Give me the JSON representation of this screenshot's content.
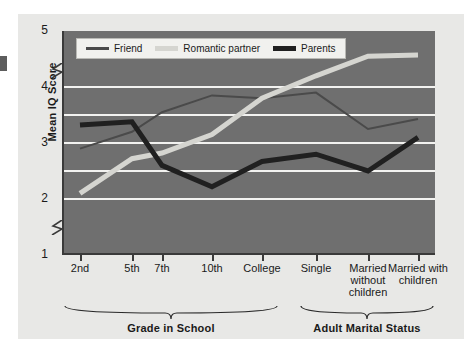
{
  "chart_data": {
    "type": "line",
    "title": "",
    "xlabel": "",
    "ylabel": "Mean IQ Score",
    "categories": [
      "2nd",
      "5th",
      "7th",
      "10th",
      "College",
      "Single",
      "Married without children",
      "Married with children"
    ],
    "ylim": [
      1,
      5
    ],
    "yticks": [
      1,
      2,
      3,
      4,
      5
    ],
    "ytick_labels": [
      "1",
      "2",
      "3",
      "4",
      "5"
    ],
    "gridlines": [
      2,
      2.5,
      3,
      3.5,
      4
    ],
    "grid": true,
    "axis_breaks": [
      1.5,
      4.3
    ],
    "legend_position": "top-left",
    "series": [
      {
        "name": "Friend",
        "color": "#4a4a4a",
        "width": 2,
        "values": [
          2.9,
          3.2,
          3.55,
          3.85,
          3.8,
          3.9,
          3.25,
          3.43
        ]
      },
      {
        "name": "Romantic partner",
        "color": "#d5d5d0",
        "width": 5,
        "values": [
          2.1,
          2.72,
          2.82,
          3.15,
          3.8,
          4.2,
          4.55,
          4.57
        ]
      },
      {
        "name": "Parents",
        "color": "#202020",
        "width": 5,
        "values": [
          3.32,
          3.38,
          2.6,
          2.22,
          2.67,
          2.8,
          2.5,
          3.1
        ]
      }
    ],
    "group_brackets": [
      {
        "label": "Grade in School",
        "from": 0,
        "to": 4
      },
      {
        "label": "Adult Marital Status",
        "from": 5,
        "to": 7
      }
    ]
  },
  "colors": {
    "plot_background": "#6f6f6f",
    "page_background": "#e8e8e6",
    "gridline": "#f2f2f0",
    "axis": "#3a3a3a",
    "text": "#1a1a1a",
    "legend_background": "#f1f1ee"
  }
}
